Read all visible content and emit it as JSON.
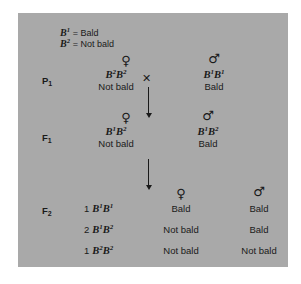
{
  "legend": {
    "rows": [
      {
        "allele": "B",
        "allele_sup": "1",
        "equals": "= Bald"
      },
      {
        "allele": "B",
        "allele_sup": "2",
        "equals": "= Not bald"
      }
    ]
  },
  "symbols": {
    "female": "♀",
    "male": "♂",
    "cross": "✕"
  },
  "generations": {
    "p1": {
      "label": "P",
      "label_sub": "1",
      "female": {
        "sex": "♀",
        "allele1": "B",
        "sup1": "2",
        "allele2": "B",
        "sup2": "2",
        "phenotype": "Not bald"
      },
      "male": {
        "sex": "♂",
        "allele1": "B",
        "sup1": "1",
        "allele2": "B",
        "sup2": "1",
        "phenotype": "Bald"
      }
    },
    "f1": {
      "label": "F",
      "label_sub": "1",
      "female": {
        "sex": "♀",
        "allele1": "B",
        "sup1": "1",
        "allele2": "B",
        "sup2": "2",
        "phenotype": "Not bald"
      },
      "male": {
        "sex": "♂",
        "allele1": "B",
        "sup1": "1",
        "allele2": "B",
        "sup2": "2",
        "phenotype": "Bald"
      }
    },
    "f2": {
      "label": "F",
      "label_sub": "2",
      "female_header": "♀",
      "male_header": "♂",
      "rows": [
        {
          "ratio": "1",
          "allele1": "B",
          "sup1": "1",
          "allele2": "B",
          "sup2": "1",
          "female_phenotype": "Bald",
          "male_phenotype": "Bald"
        },
        {
          "ratio": "2",
          "allele1": "B",
          "sup1": "1",
          "allele2": "B",
          "sup2": "2",
          "female_phenotype": "Not bald",
          "male_phenotype": "Bald"
        },
        {
          "ratio": "1",
          "allele1": "B",
          "sup1": "2",
          "allele2": "B",
          "sup2": "2",
          "female_phenotype": "Not bald",
          "male_phenotype": "Not bald"
        }
      ]
    }
  },
  "colors": {
    "panel_background": "#a9a9a9",
    "text": "#1a1a1a",
    "page_background": "#ffffff"
  }
}
